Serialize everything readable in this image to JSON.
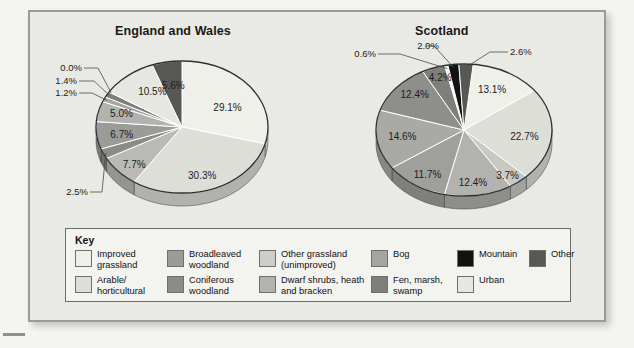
{
  "charts": {
    "england": {
      "title": "England and Wales"
    },
    "scotland": {
      "title": "Scotland"
    }
  },
  "legend": {
    "title": "Key",
    "items": [
      {
        "label": "Improved grassland",
        "color": "#f0f0ea"
      },
      {
        "label": "Broadleaved woodland",
        "color": "#9b9b98"
      },
      {
        "label": "Other grassland (unimproved)",
        "color": "#cdcdc9"
      },
      {
        "label": "Bog",
        "color": "#a4a4a0"
      },
      {
        "label": "Mountain",
        "color": "#121212"
      },
      {
        "label": "Other",
        "color": "#575754"
      },
      {
        "label": "Arable/ horticultural",
        "color": "#dedeD8"
      },
      {
        "label": "Coniferous woodland",
        "color": "#8b8b87"
      },
      {
        "label": "Dwarf shrubs, heath and bracken",
        "color": "#b2b2ae"
      },
      {
        "label": "Fen, marsh, swamp",
        "color": "#7e7e7a"
      },
      {
        "label": "Urban",
        "color": "#e7e7e1"
      }
    ]
  },
  "chart_data": [
    {
      "type": "pie",
      "title": "England and Wales",
      "categories": [
        "Improved grassland",
        "Arable/horticultural",
        "Other grassland (unimproved)",
        "Broadleaved woodland",
        "Coniferous woodland",
        "Dwarf shrubs, heath and bracken",
        "Bog",
        "Fen, marsh, swamp",
        "Mountain",
        "Urban",
        "Other"
      ],
      "values": [
        29.1,
        30.3,
        7.7,
        2.5,
        6.7,
        5.0,
        1.2,
        1.4,
        0.0,
        10.5,
        5.6
      ],
      "labels": [
        "29.1%",
        "30.3%",
        "7.7%",
        "2.5%",
        "6.7%",
        "5.0%",
        "1.2%",
        "1.4%",
        "0.0%",
        "10.5%",
        "5.6%"
      ],
      "colors": [
        "#f0f0ea",
        "#dedeD8",
        "#b9b9b5",
        "#8b8b87",
        "#9b9b98",
        "#b2b2ae",
        "#a4a4a0",
        "#7e7e7a",
        "#121212",
        "#e7e7e1",
        "#575754"
      ],
      "xlabel": "",
      "ylabel": "",
      "legend_position": "bottom"
    },
    {
      "type": "pie",
      "title": "Scotland",
      "categories": [
        "Improved grassland",
        "Arable/horticultural",
        "Other grassland (unimproved)",
        "Dwarf shrubs, heath and bracken",
        "Coniferous woodland",
        "Bog",
        "Broadleaved woodland",
        "Fen, marsh, swamp",
        "Urban",
        "Mountain",
        "Other"
      ],
      "values": [
        13.1,
        22.7,
        3.7,
        12.4,
        11.7,
        14.6,
        12.4,
        4.2,
        0.6,
        2.0,
        2.6
      ],
      "labels": [
        "13.1%",
        "22.7%",
        "3.7%",
        "12.4%",
        "11.7%",
        "14.6%",
        "12.4%",
        "4.2%",
        "0.6%",
        "2.0%",
        "2.6%"
      ],
      "colors": [
        "#f0f0ea",
        "#dedeD8",
        "#c9c9c4",
        "#b2b2ae",
        "#9f9f9b",
        "#a9a9a5",
        "#8e8e8a",
        "#7e7e7a",
        "#f3f3ef",
        "#121212",
        "#575754"
      ],
      "xlabel": "",
      "ylabel": "",
      "legend_position": "bottom"
    }
  ]
}
